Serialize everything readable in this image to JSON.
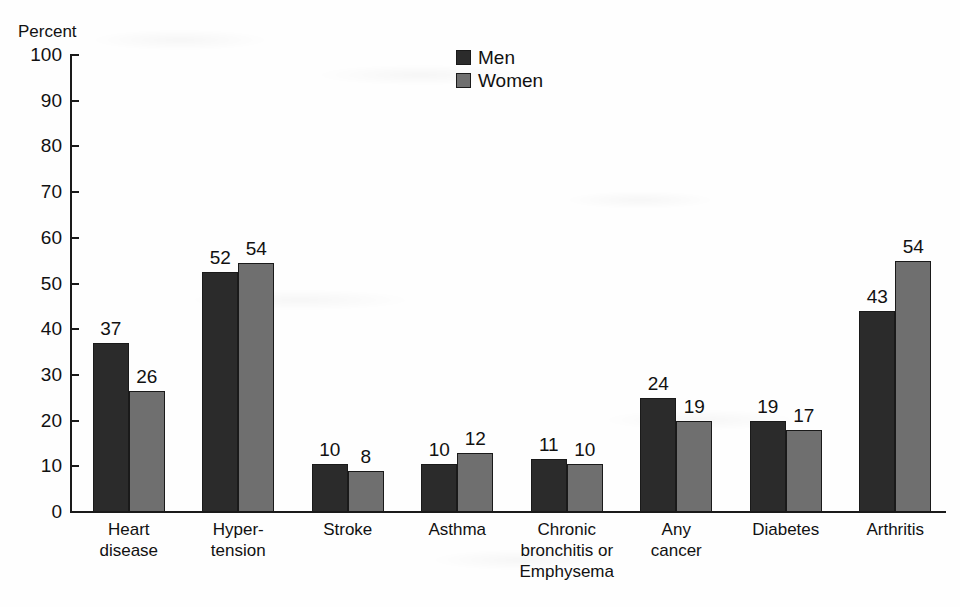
{
  "chart_data": {
    "type": "bar",
    "title": "",
    "xlabel": "",
    "ylabel": "Percent",
    "ylim": [
      0,
      100
    ],
    "ytick_step": 10,
    "yticks": [
      100,
      90,
      80,
      70,
      60,
      50,
      40,
      30,
      20,
      10,
      0
    ],
    "grid": false,
    "legend_position": "top-center",
    "categories": [
      "Heart\ndisease",
      "Hyper-\ntension",
      "Stroke",
      "Asthma",
      "Chronic\nbronchitis or\nEmphysema",
      "Any\ncancer",
      "Diabetes",
      "Arthritis"
    ],
    "series": [
      {
        "name": "Men",
        "color": "#2b2b2b",
        "values": [
          37,
          52,
          10,
          10,
          11,
          24,
          19,
          43
        ],
        "bar_heights": [
          37,
          52.5,
          10.5,
          10.5,
          11.5,
          25,
          20,
          44
        ]
      },
      {
        "name": "Women",
        "color": "#6f6f6f",
        "values": [
          26,
          54,
          8,
          12,
          10,
          19,
          17,
          54
        ],
        "bar_heights": [
          26.5,
          54.5,
          9,
          13,
          10.5,
          20,
          18,
          55
        ]
      }
    ]
  },
  "axis": {
    "y_title": "Percent"
  },
  "legend": {
    "items": [
      {
        "label": "Men",
        "swatch": "men"
      },
      {
        "label": "Women",
        "swatch": "women"
      }
    ]
  },
  "colors": {
    "men": "#2b2b2b",
    "women": "#6f6f6f",
    "axis": "#1a1a1a",
    "background": "#fefefe"
  }
}
